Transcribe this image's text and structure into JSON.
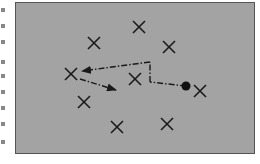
{
  "diagram": {
    "background_color": "#a3a3a3",
    "border_color": "#555555",
    "marker_color": "#1a1a1a",
    "markers": [
      {
        "x": 139,
        "y": 27
      },
      {
        "x": 94,
        "y": 43
      },
      {
        "x": 169,
        "y": 47
      },
      {
        "x": 71,
        "y": 74
      },
      {
        "x": 135,
        "y": 79
      },
      {
        "x": 200,
        "y": 91
      },
      {
        "x": 84,
        "y": 102
      },
      {
        "x": 117,
        "y": 127
      },
      {
        "x": 167,
        "y": 124
      }
    ],
    "start_point": {
      "x": 186,
      "y": 86
    },
    "path": {
      "style": "dash-dot",
      "segments": [
        {
          "from": [
            186,
            86
          ],
          "to": [
            150,
            82
          ]
        },
        {
          "from": [
            150,
            82
          ],
          "to": [
            150,
            62
          ]
        },
        {
          "from": [
            150,
            62
          ],
          "to": [
            82,
            71
          ],
          "arrow": true
        },
        {
          "from": [
            80,
            79
          ],
          "to": [
            116,
            90
          ],
          "arrow": true
        }
      ]
    }
  },
  "edge_fragments": [
    6,
    22,
    38,
    58,
    72,
    88,
    104,
    120,
    138
  ]
}
